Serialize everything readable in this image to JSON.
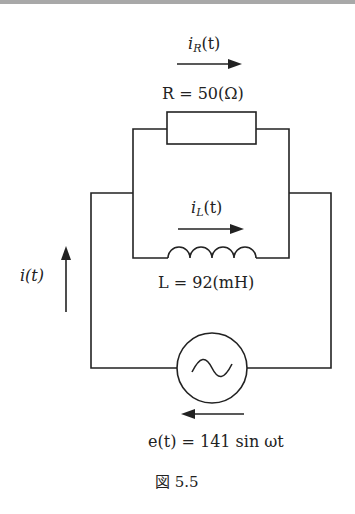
{
  "figure": {
    "caption": "図 5.5",
    "caption_prefix": "図",
    "caption_number": "5.5"
  },
  "labels": {
    "iR": {
      "var": "i",
      "sub": "R",
      "arg": "(t)"
    },
    "R": {
      "text": "R = 50(Ω)",
      "symbol": "R",
      "value": "50",
      "unit": "(Ω)"
    },
    "iL": {
      "var": "i",
      "sub": "L",
      "arg": "(t)"
    },
    "L": {
      "text": "L = 92(mH)",
      "symbol": "L",
      "value": "92",
      "unit": "(mH)"
    },
    "i": {
      "text": "i(t)"
    },
    "e": {
      "text": "e(t) = 141 sin ωt",
      "lhs": "e(t)",
      "rhs": "141 sin ωt"
    }
  },
  "components": [
    {
      "type": "resistor",
      "name": "R",
      "value": "50 Ω"
    },
    {
      "type": "inductor",
      "name": "L",
      "value": "92 mH"
    },
    {
      "type": "ac-source",
      "name": "e(t)",
      "expression": "141 sin ωt"
    }
  ],
  "colors": {
    "wire": "#222222",
    "text": "#222222",
    "topbar": "#a8a8a8"
  }
}
